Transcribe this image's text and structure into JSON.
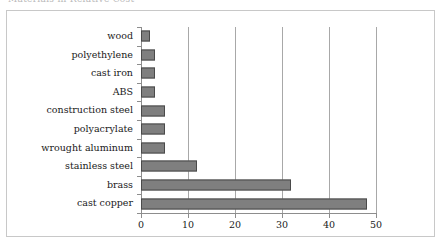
{
  "caption_fragment": "Materials in Relative Cost",
  "colors": {
    "bar_fill": "#7f7f7f",
    "bar_border": "#4a4a4a",
    "gridline": "#a8a8a8",
    "axis": "#8d8d8d",
    "frame": "#c8c8c8",
    "text": "#1a1a1a",
    "background": "#ffffff"
  },
  "chart_data": {
    "type": "bar",
    "orientation": "horizontal",
    "title": "",
    "xlabel": "",
    "ylabel": "",
    "xlim": [
      0,
      50
    ],
    "ylim": null,
    "grid": true,
    "legend": false,
    "xticks": [
      0,
      10,
      20,
      30,
      40,
      50
    ],
    "xtick_labels": [
      "0",
      "10",
      "20",
      "30",
      "40",
      "50"
    ],
    "categories": [
      "wood",
      "polyethylene",
      "cast iron",
      "ABS",
      "construction steel",
      "polyacrylate",
      "wrought aluminum",
      "stainless steel",
      "brass",
      "cast copper"
    ],
    "values": [
      2,
      3,
      3,
      3,
      5,
      5,
      5,
      12,
      32,
      48
    ]
  }
}
